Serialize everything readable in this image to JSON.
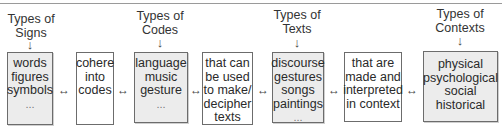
{
  "diagram": {
    "categories": [
      {
        "label_line1": "Types of",
        "label_line2": "Signs",
        "arrow": "↓"
      },
      {
        "label_line1": "Types of",
        "label_line2": "Codes",
        "arrow": "↓"
      },
      {
        "label_line1": "Types of",
        "label_line2": "Texts",
        "arrow": "↓"
      },
      {
        "label_line1": "Types of",
        "label_line2": "Contexts",
        "arrow": "↓"
      }
    ],
    "boxes": [
      {
        "lines": [
          "words",
          "figures",
          "symbols",
          "..."
        ]
      },
      {
        "lines": [
          "cohere",
          "into",
          "codes"
        ]
      },
      {
        "lines": [
          "language",
          "music",
          "gesture",
          "..."
        ]
      },
      {
        "lines": [
          "that can",
          "be used",
          "to make/",
          "decipher",
          "texts"
        ]
      },
      {
        "lines": [
          "discourse",
          "gestures",
          "songs",
          "paintings",
          "..."
        ]
      },
      {
        "lines": [
          "that are",
          "made and",
          "interpreted",
          "in context"
        ]
      },
      {
        "lines": [
          "physical",
          "psychological",
          "social",
          "historical"
        ]
      }
    ],
    "connector": "↔",
    "colors": {
      "category_box_fill": "#ececec",
      "link_box_fill": "#ffffff",
      "border": "#6c6c6c"
    }
  }
}
